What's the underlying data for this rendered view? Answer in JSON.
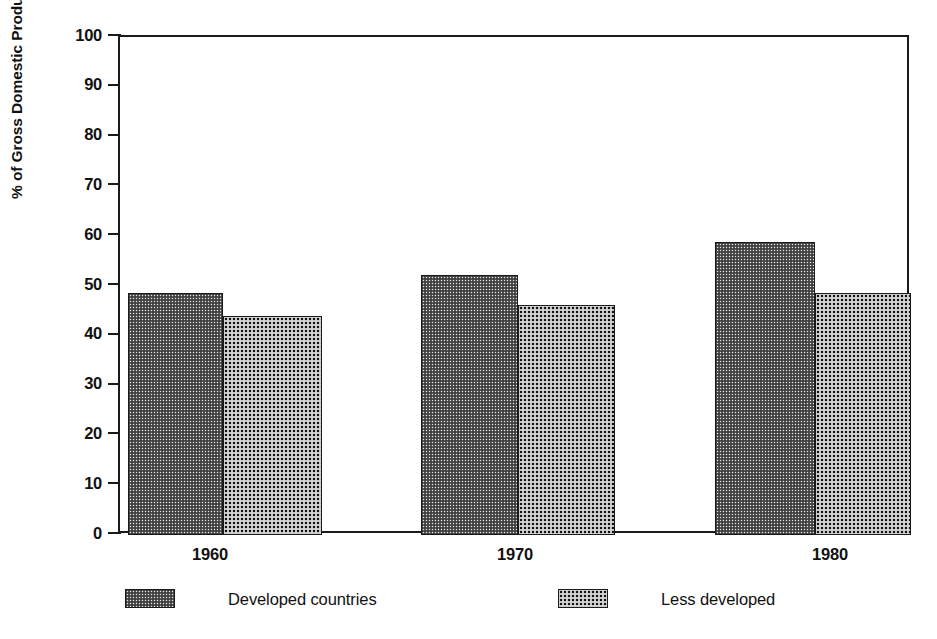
{
  "chart_data": {
    "type": "bar",
    "title": "",
    "subtitle": "",
    "xlabel": "",
    "ylabel": "% of Gross Domestic Product",
    "categories": [
      "1960",
      "1970",
      "1980"
    ],
    "series": [
      {
        "name": "Developed countries",
        "values": [
          48.5,
          52.3,
          58.9
        ],
        "fill": "light-halftone",
        "color": "#e9e9e9"
      },
      {
        "name": "Less developed",
        "values": [
          44.0,
          46.2,
          48.5
        ],
        "fill": "dark-halftone",
        "color": "#111111"
      }
    ],
    "ylim": [
      0,
      100
    ],
    "ytick_values": [
      0,
      10,
      20,
      30,
      40,
      50,
      60,
      70,
      80,
      90,
      100
    ],
    "ytick_labels": [
      "0",
      "10",
      "20",
      "30",
      "40",
      "50",
      "60",
      "70",
      "80",
      "90",
      "100"
    ],
    "grid": false,
    "legend_position": "bottom",
    "bar_gap": 0,
    "frame": "box"
  },
  "axes": {
    "y_title": "% of Gross Domestic Product",
    "y_ticks": [
      {
        "value": 100,
        "label": "100"
      },
      {
        "value": 90,
        "label": "90"
      },
      {
        "value": 80,
        "label": "80"
      },
      {
        "value": 70,
        "label": "70"
      },
      {
        "value": 60,
        "label": "60"
      },
      {
        "value": 50,
        "label": "50"
      },
      {
        "value": 40,
        "label": "40"
      },
      {
        "value": 30,
        "label": "30"
      },
      {
        "value": 20,
        "label": "20"
      },
      {
        "value": 10,
        "label": "10"
      },
      {
        "value": 0,
        "label": "0"
      }
    ],
    "x_labels": [
      "1960",
      "1970",
      "1980"
    ]
  },
  "legend": {
    "items": [
      {
        "label": "Developed countries",
        "style": "light"
      },
      {
        "label": "Less developed",
        "style": "dark"
      }
    ]
  },
  "colors": {
    "axis": "#1a1a1a",
    "text": "#111111",
    "background": "#ffffff",
    "series_light": "#e9e9e9",
    "series_dark": "#111111"
  }
}
